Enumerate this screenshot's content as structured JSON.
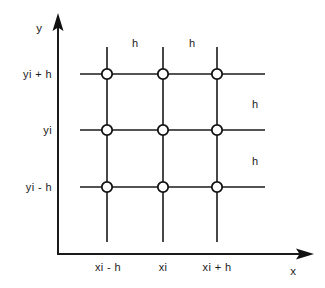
{
  "figure": {
    "type": "diagram",
    "background_color": "#ffffff",
    "ink_color": "#1a1a1a",
    "node_fill": "#ffffff",
    "node_stroke": "#111111"
  },
  "axes": {
    "x_axis": {
      "label": "x",
      "label_pos": {
        "x": 293,
        "y": 272
      },
      "line": {
        "x1": 58,
        "y1": 254,
        "x2": 303,
        "y2": 254
      },
      "arrow_tip_x": 313,
      "ticks": [
        {
          "label": "xi - h",
          "x": 108
        },
        {
          "label": "xi",
          "x": 163
        },
        {
          "label": "xi + h",
          "x": 217
        }
      ],
      "tick_label_y": 271
    },
    "y_axis": {
      "label": "y",
      "label_pos": {
        "x": 39,
        "y": 32
      },
      "line": {
        "x1": 58,
        "y1": 254,
        "x2": 58,
        "y2": 26
      },
      "arrow_tip_y": 14,
      "ticks": [
        {
          "label": "yi + h",
          "y": 78
        },
        {
          "label": "yi",
          "y": 134
        },
        {
          "label": "yi - h",
          "y": 191
        }
      ],
      "tick_label_right_x": 52
    }
  },
  "grid": {
    "columns_x": [
      107,
      163,
      217
    ],
    "rows_y": [
      74,
      130,
      187
    ],
    "horizontal_extent": {
      "x_start": 80,
      "x_end": 265
    },
    "vertical_extent": {
      "y_start": 47,
      "y_end": 242
    },
    "node_radius": 5.2,
    "node_count": 9
  },
  "spacing_labels": [
    {
      "id": "h-top-left",
      "text": "h",
      "x": 135,
      "y": 47
    },
    {
      "id": "h-top-right",
      "text": "h",
      "x": 192,
      "y": 47
    },
    {
      "id": "h-right-upper",
      "text": "h",
      "x": 255,
      "y": 108
    },
    {
      "id": "h-right-lower",
      "text": "h",
      "x": 255,
      "y": 165
    }
  ]
}
